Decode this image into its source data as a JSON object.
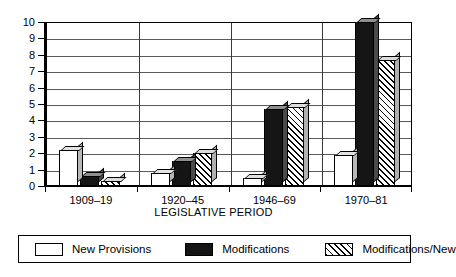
{
  "chart_data": {
    "type": "bar",
    "title": "",
    "xlabel": "LEGISLATIVE PERIOD",
    "ylabel": "",
    "categories": [
      "1909–19",
      "1920–45",
      "1946–69",
      "1970–81"
    ],
    "series": [
      {
        "name": "New Provisions",
        "values": [
          2.2,
          0.8,
          0.5,
          1.9
        ]
      },
      {
        "name": "Modifications",
        "values": [
          0.6,
          1.5,
          4.7,
          10.0
        ]
      },
      {
        "name": "Modifications/New",
        "values": [
          0.3,
          2.0,
          4.8,
          7.7
        ]
      }
    ],
    "ylim": [
      0,
      10
    ],
    "yticks": [
      "0",
      "1",
      "2",
      "3",
      "4",
      "5",
      "6",
      "7",
      "8",
      "9",
      "10"
    ],
    "grid": true,
    "legend_position": "bottom",
    "style": "3d-bars-grayscale",
    "colors": {
      "new_provisions": "#ffffff",
      "modifications": "#151515",
      "modifications_new": "#ffffff-hatched",
      "axis": "#000000",
      "gridline": "#5a5a5a",
      "background": "#ffffff"
    }
  },
  "legend": {
    "items": [
      {
        "label": "New Provisions",
        "swatch": "white-swatch"
      },
      {
        "label": "Modifications",
        "swatch": "black-swatch"
      },
      {
        "label": "Modifications/New",
        "swatch": "hatched-swatch"
      }
    ]
  }
}
